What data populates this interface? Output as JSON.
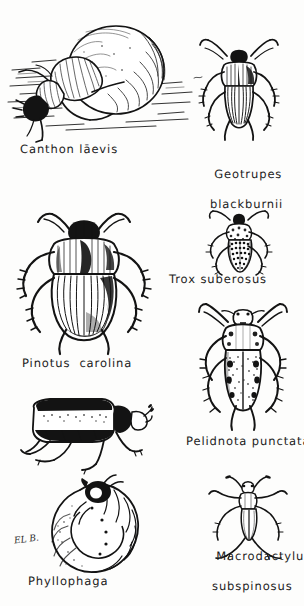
{
  "plate": {
    "title": "Scarab beetle illustration plate",
    "background_color": "#fdfdfc",
    "ink_color": "#131313",
    "signature": "EL B.",
    "medium": "pen-and-ink line drawing"
  },
  "figures": [
    {
      "id": "canthon-laevis",
      "caption": "Canthon lāevis",
      "caption_plain": "Canthon laevis",
      "subject": "tumblebug dung beetle rolling dung ball",
      "view": "lateral",
      "caption_lines": 1,
      "column": "left",
      "row": 1
    },
    {
      "id": "geotrupes-blackburnii",
      "caption_line1": "Geotrupes",
      "caption_line2": "blackburnii",
      "caption_plain": "Geotrupes blackburnii",
      "subject": "earth-boring dung beetle",
      "view": "dorsal",
      "caption_lines": 2,
      "column": "right",
      "row": 1
    },
    {
      "id": "pinotus-carolina",
      "caption": "Pinotus  carolina",
      "caption_plain": "Pinotus carolina",
      "subject": "large dung beetle",
      "view": "dorsal",
      "caption_lines": 1,
      "column": "left",
      "row": 2
    },
    {
      "id": "trox-suberosus",
      "caption": "Trox suberosus",
      "caption_plain": "Trox suberosus",
      "subject": "hide beetle",
      "view": "dorsal",
      "caption_lines": 1,
      "column": "right",
      "row": 2
    },
    {
      "id": "pelidnota-punctata",
      "caption": "Pelidnota punctata",
      "caption_plain": "Pelidnota punctata",
      "subject": "spotted grapevine beetle",
      "view": "dorsal",
      "caption_lines": 1,
      "column": "right",
      "row": 3
    },
    {
      "id": "phyllophaga",
      "caption": "Phyllophaga",
      "caption_plain": "Phyllophaga",
      "subject": "May beetle adult and white grub larva",
      "view": "lateral adult, curled larva",
      "caption_lines": 1,
      "column": "left",
      "row": 3
    },
    {
      "id": "macrodactylus-subspinosus",
      "caption_line1": "Macrodactylus",
      "caption_line2": "subspinosus",
      "caption_plain": "Macrodactylus subspinosus",
      "subject": "rose chafer",
      "view": "dorsal",
      "caption_lines": 2,
      "column": "right",
      "row": 4
    }
  ]
}
